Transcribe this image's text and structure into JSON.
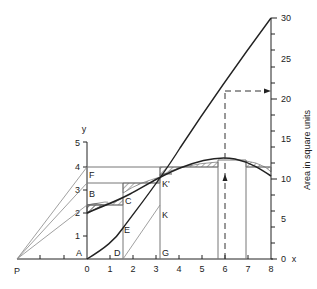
{
  "diagram": {
    "title": "",
    "left_axis": {
      "label": "y",
      "ticks": [
        "1",
        "2",
        "3",
        "4",
        "5"
      ]
    },
    "x_axis": {
      "label": "x",
      "ticks": [
        "0",
        "1",
        "2",
        "3",
        "4",
        "5",
        "6",
        "7",
        "8"
      ]
    },
    "right_axis": {
      "label": "Area in square units",
      "ticks": [
        "0",
        "5",
        "10",
        "15",
        "20",
        "25",
        "30"
      ]
    },
    "points": {
      "P": "P",
      "A": "A",
      "B": "B",
      "C": "C",
      "D": "D",
      "E": "E",
      "F": "F",
      "G": "G",
      "K": "K",
      "K_prime": "K'"
    },
    "colors": {
      "line": "#222222",
      "thin_line": "#777777",
      "hatch": "#555555",
      "background": "#ffffff"
    }
  }
}
